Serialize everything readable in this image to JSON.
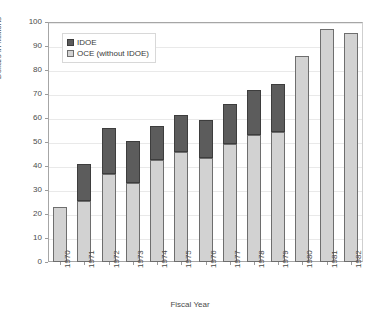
{
  "chart_data": {
    "type": "bar",
    "title": "",
    "xlabel": "Fiscal Year",
    "ylabel": "Dollars in Millions",
    "ylim": [
      0,
      100
    ],
    "ytick_step": 10,
    "yticks": [
      0,
      10,
      20,
      30,
      40,
      50,
      60,
      70,
      80,
      90,
      100
    ],
    "grid": true,
    "stacked": true,
    "legend_position": "top-left inside plot",
    "categories": [
      "1970",
      "1971",
      "1972",
      "1973",
      "1974",
      "1975",
      "1976",
      "1977",
      "1978",
      "1979",
      "1980",
      "1981",
      "1982"
    ],
    "series": [
      {
        "name": "OCE (without IDOE)",
        "color": "#d2d2d2",
        "values": [
          23.0,
          25.5,
          36.5,
          33.0,
          42.5,
          46.0,
          43.3,
          49.0,
          53.0,
          54.3,
          86.0,
          97.0,
          95.3
        ]
      },
      {
        "name": "IDOE",
        "color": "#5c5c5c",
        "values": [
          0.0,
          15.5,
          19.5,
          17.3,
          14.2,
          15.3,
          16.0,
          17.0,
          18.5,
          20.0,
          0.0,
          0.0,
          0.0
        ]
      }
    ],
    "totals": [
      23.0,
      41.0,
      56.0,
      50.3,
      56.7,
      61.3,
      59.3,
      66.0,
      71.5,
      74.3,
      86.0,
      97.0,
      95.3
    ]
  },
  "legend": {
    "entries": [
      {
        "label": "IDOE",
        "swatch": "dark-swatch-icon"
      },
      {
        "label": "OCE (without IDOE)",
        "swatch": "light-swatch-icon"
      }
    ]
  }
}
